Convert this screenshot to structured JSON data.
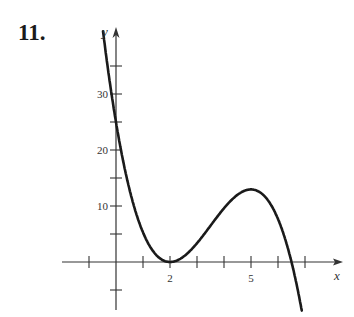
{
  "problem_number": "11.",
  "chart_data": {
    "type": "line",
    "title": "",
    "xlabel": "x",
    "ylabel": "y",
    "x_ticks": [
      -1,
      0,
      1,
      2,
      3,
      4,
      5,
      6,
      7
    ],
    "x_tick_labels": [
      {
        "value": 2,
        "label": "2"
      },
      {
        "value": 5,
        "label": "5"
      }
    ],
    "y_ticks": [
      -5,
      5,
      10,
      15,
      20,
      25,
      30,
      35
    ],
    "y_tick_labels": [
      {
        "value": 10,
        "label": "10"
      },
      {
        "value": 20,
        "label": "20"
      },
      {
        "value": 30,
        "label": "30"
      }
    ],
    "xlim": [
      -2,
      8.5
    ],
    "ylim": [
      -10,
      42
    ],
    "grid": false,
    "series": [
      {
        "name": "f(x)",
        "description": "polynomial with double root at x=2, local max near x=5 (~13.5), root near x=6.5",
        "x": [
          -0.5,
          0,
          0.5,
          1,
          1.5,
          2,
          2.5,
          3,
          3.5,
          4,
          4.5,
          5,
          5.5,
          6,
          6.5,
          7
        ],
        "y": [
          42,
          25,
          12.9,
          5.3,
          1.2,
          0,
          1.0,
          3.4,
          6.5,
          9.6,
          12.0,
          13.0,
          11.8,
          7.7,
          0,
          -12
        ]
      }
    ]
  }
}
